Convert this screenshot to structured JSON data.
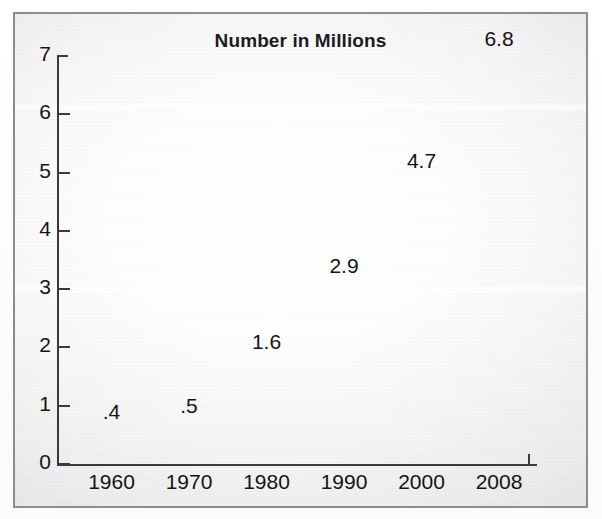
{
  "figure": {
    "frame_border_color": "#8d8d8d",
    "background_color": "#f7f7f7"
  },
  "chart_data": {
    "type": "bar",
    "title": "Number in Millions",
    "xlabel": "",
    "ylabel": "",
    "categories": [
      "1960",
      "1970",
      "1980",
      "1990",
      "2000",
      "2008"
    ],
    "values": [
      0.4,
      0.5,
      1.6,
      2.9,
      4.7,
      6.8
    ],
    "value_labels": [
      ".4",
      ".5",
      "1.6",
      "2.9",
      "4.7",
      "6.8"
    ],
    "ylim": [
      0,
      7
    ],
    "yticks": [
      0,
      1,
      2,
      3,
      4,
      5,
      6,
      7
    ],
    "ytick_labels": [
      "0",
      "1",
      "2",
      "3",
      "4",
      "5",
      "6",
      "7"
    ],
    "grid": false,
    "legend": false,
    "style": "3d-bar",
    "bar_front_color": "#424242",
    "bar_side_color": "#6f6f6f",
    "bar_top_color": "#6a6a6a",
    "axis_color": "#3a3a3a",
    "text_color": "#141414"
  },
  "bars": [
    {
      "category": "1960",
      "value": 0.4,
      "label": ".4"
    },
    {
      "category": "1970",
      "value": 0.5,
      "label": ".5"
    },
    {
      "category": "1980",
      "value": 1.6,
      "label": "1.6"
    },
    {
      "category": "1990",
      "value": 2.9,
      "label": "2.9"
    },
    {
      "category": "2000",
      "value": 4.7,
      "label": "4.7"
    },
    {
      "category": "2008",
      "value": 6.8,
      "label": "6.8"
    }
  ],
  "yticks": [
    {
      "label": "7",
      "value": 7
    },
    {
      "label": "6",
      "value": 6
    },
    {
      "label": "5",
      "value": 5
    },
    {
      "label": "4",
      "value": 4
    },
    {
      "label": "3",
      "value": 3
    },
    {
      "label": "2",
      "value": 2
    },
    {
      "label": "1",
      "value": 1
    },
    {
      "label": "0",
      "value": 0
    }
  ]
}
